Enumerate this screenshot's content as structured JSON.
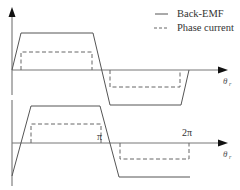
{
  "legend": {
    "items": [
      {
        "label": "Back-EMF",
        "style": "solid"
      },
      {
        "label": "Phase current",
        "style": "dashed"
      }
    ]
  },
  "panels": [
    {
      "name": "top",
      "axis_label": "θ",
      "axis_label_sub": "r",
      "ticks": []
    },
    {
      "name": "bottom",
      "axis_label": "θ",
      "axis_label_sub": "r",
      "ticks": [
        {
          "label": "π"
        },
        {
          "label": "2π"
        }
      ]
    }
  ],
  "colors": {
    "line": "#555555",
    "axis": "#777777",
    "arrow": "#111111"
  }
}
